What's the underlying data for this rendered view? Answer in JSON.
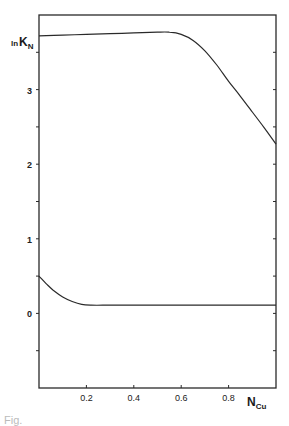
{
  "chart_data": {
    "type": "line",
    "title": "",
    "xlabel": "N_Cu",
    "ylabel": "ln K_N",
    "xlim": [
      0,
      1.0
    ],
    "ylim": [
      -1.0,
      4.0
    ],
    "x_ticks": [
      0.2,
      0.4,
      0.6,
      0.8
    ],
    "x_tick_labels": [
      "0.2",
      "0.4",
      "0.6",
      "0.8"
    ],
    "x_minor_ticks": [],
    "y_ticks": [
      -0.5,
      0,
      0.5,
      1,
      1.5,
      2,
      2.5,
      3,
      3.5
    ],
    "y_tick_labels": [
      "0",
      "1",
      "2",
      "3"
    ],
    "y_labeled_values": [
      0,
      1,
      2,
      3
    ],
    "grid": false,
    "legend": null,
    "series": [
      {
        "name": "upper curve",
        "x": [
          0.0,
          0.1,
          0.2,
          0.3,
          0.4,
          0.5,
          0.55,
          0.6,
          0.65,
          0.7,
          0.75,
          0.8,
          0.85,
          0.9,
          0.95,
          1.0
        ],
        "y": [
          3.72,
          3.73,
          3.74,
          3.75,
          3.76,
          3.77,
          3.77,
          3.74,
          3.66,
          3.52,
          3.33,
          3.11,
          2.91,
          2.7,
          2.49,
          2.27
        ]
      },
      {
        "name": "lower curve",
        "x": [
          0.0,
          0.03,
          0.06,
          0.1,
          0.14,
          0.18,
          0.22,
          0.3,
          0.4,
          0.5,
          0.6,
          0.7,
          0.8,
          0.9,
          1.0
        ],
        "y": [
          0.5,
          0.4,
          0.31,
          0.22,
          0.16,
          0.12,
          0.11,
          0.11,
          0.11,
          0.11,
          0.11,
          0.11,
          0.11,
          0.11,
          0.11
        ]
      }
    ]
  },
  "labels": {
    "y_axis_main": "ln",
    "y_axis_K": "K",
    "y_axis_sub": "N",
    "x_axis_main": "N",
    "x_axis_sub": "Cu",
    "caption_fragment": "Fig."
  },
  "colors": {
    "line": "#2a2a2a",
    "frame": "#2a2a2a",
    "background": "#ffffff"
  }
}
